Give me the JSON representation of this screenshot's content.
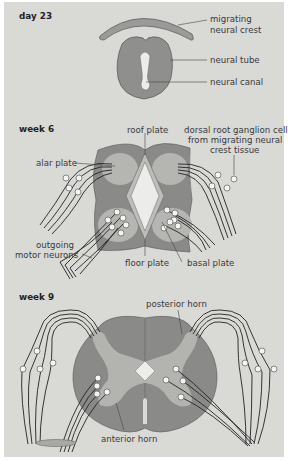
{
  "figure": {
    "panels": [
      {
        "title": "day 23",
        "labels": {
          "neural_crest": [
            "migrating",
            "neural crest"
          ],
          "neural_tube": "neural tube",
          "neural_canal": "neural canal"
        }
      },
      {
        "title": "week 6",
        "labels": {
          "roof_plate": "roof plate",
          "drg": [
            "dorsal root ganglion cell",
            "from migrating neural",
            "crest tissue"
          ],
          "alar_plate": "alar plate",
          "motor": [
            "outgoing",
            "motor neurons"
          ],
          "floor_plate": "floor plate",
          "basal_plate": "basal plate"
        }
      },
      {
        "title": "week 9",
        "labels": {
          "posterior_horn": "posterior horn",
          "anterior_horn": "anterior horn"
        }
      }
    ],
    "colors": {
      "background": "#d9d9d6",
      "tissue_dark": "#8a8a88",
      "tissue_mid": "#b3b3b0",
      "tissue_light": "#e8e8e6",
      "line": "#2a2a2a"
    }
  }
}
